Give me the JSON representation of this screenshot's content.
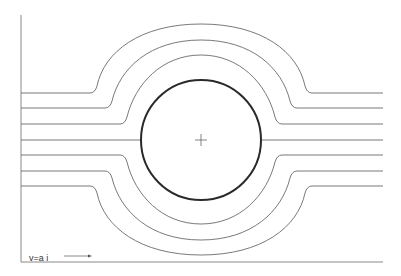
{
  "figure": {
    "velocity_label": "v=a i",
    "arrow_direction": "right",
    "colors": {
      "background": "#ffffff",
      "cylinder": "#2a2a2a",
      "streamlines": "#6a6a6a",
      "axes": "#7a7a7a"
    },
    "cylinder": {
      "cx": 201,
      "cy": 140,
      "r": 60
    },
    "streamline_count": 7,
    "streamline_y": [
      93,
      108,
      124,
      140,
      155,
      171,
      186
    ]
  }
}
